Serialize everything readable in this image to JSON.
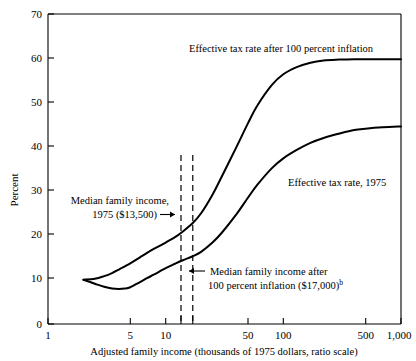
{
  "chart_data": {
    "type": "line",
    "title": "",
    "xlabel": "Adjusted family income (thousands of 1975 dollars, ratio scale)",
    "ylabel": "Percent",
    "xscale": "log",
    "xlim": [
      1,
      1000
    ],
    "ylim": [
      0,
      70
    ],
    "grid": false,
    "legend": "inline-annotations",
    "xticks": [
      1,
      5,
      10,
      50,
      100,
      500,
      1000
    ],
    "xticklabels": [
      "1",
      "5",
      "10",
      "50",
      "100",
      "500",
      "1,000"
    ],
    "yticks": [
      0,
      10,
      20,
      30,
      40,
      50,
      60,
      70
    ],
    "yticklabels": [
      "0",
      "10",
      "20",
      "30",
      "40",
      "50",
      "60",
      "70"
    ],
    "series": [
      {
        "name": "Effective tax rate after 100 percent inflation",
        "x": [
          2,
          2.5,
          3,
          3.5,
          4,
          5,
          6,
          7,
          8,
          10,
          12,
          14,
          17,
          20,
          25,
          30,
          40,
          50,
          60,
          80,
          100,
          130,
          170,
          220,
          300,
          400,
          500,
          700,
          1000
        ],
        "values": [
          10.0,
          10.2,
          10.8,
          11.5,
          12.3,
          13.7,
          15.0,
          16.1,
          17.0,
          18.4,
          19.6,
          20.9,
          22.8,
          25.0,
          29.2,
          33.3,
          40.0,
          45.3,
          49.3,
          54.0,
          56.4,
          58.0,
          59.0,
          59.5,
          59.7,
          59.8,
          59.8,
          59.8,
          59.8
        ]
      },
      {
        "name": "Effective tax rate, 1975",
        "x": [
          2,
          2.5,
          3,
          3.5,
          4,
          4.5,
          5,
          6,
          7,
          8,
          10,
          12,
          14,
          17,
          20,
          25,
          30,
          40,
          50,
          60,
          80,
          100,
          130,
          170,
          220,
          300,
          400,
          500,
          700,
          1000
        ],
        "values": [
          10.0,
          9.1,
          8.4,
          8.0,
          7.9,
          8.0,
          8.3,
          9.4,
          10.4,
          11.2,
          12.6,
          13.6,
          14.4,
          15.3,
          16.3,
          18.4,
          20.6,
          24.8,
          28.5,
          31.4,
          35.2,
          37.4,
          39.3,
          40.9,
          42.0,
          43.0,
          43.8,
          44.1,
          44.4,
          44.6
        ]
      }
    ],
    "annotations": [
      {
        "name": "median-income-1975",
        "lines": [
          "Median family income,",
          "1975 ($13,500)"
        ],
        "arrow": "right",
        "marker_x": 13.5,
        "vertical_line": true
      },
      {
        "name": "median-income-after-inflation",
        "lines": [
          "Median family income after",
          "100 percent inflation ($17,000)"
        ],
        "superscript": "b",
        "arrow": "left",
        "marker_x": 17.0,
        "vertical_line": true
      },
      {
        "name": "curve-label-inflation",
        "lines": [
          "Effective tax rate after 100 percent inflation"
        ]
      },
      {
        "name": "curve-label-1975",
        "lines": [
          "Effective tax rate, 1975"
        ]
      }
    ]
  },
  "axes": {
    "y_axis_title": "Percent",
    "x_axis_title": "Adjusted family income (thousands of 1975 dollars, ratio scale)"
  },
  "labels": {
    "y": [
      "70",
      "60",
      "50",
      "40",
      "30",
      "20",
      "10",
      "0"
    ],
    "x": [
      "1",
      "5",
      "10",
      "50",
      "100",
      "500",
      "1,000"
    ],
    "curve_upper": "Effective tax rate after 100 percent inflation",
    "curve_lower": "Effective tax rate, 1975",
    "anno1_line1": "Median family income,",
    "anno1_line2": "1975 ($13,500)",
    "anno2_line1": "Median family income after",
    "anno2_line2": "100 percent inflation ($17,000)",
    "anno2_sup": "b"
  },
  "colors": {
    "ink": "#000000",
    "background": "#ffffff"
  }
}
